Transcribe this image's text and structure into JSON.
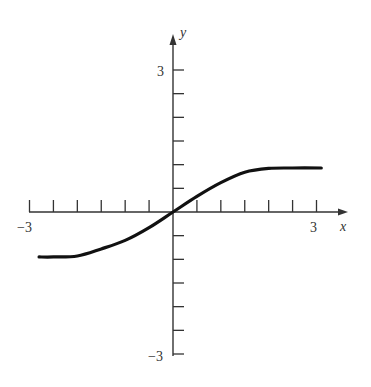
{
  "chart_data": {
    "type": "line",
    "title": "",
    "xlabel": "x",
    "ylabel": "y",
    "xlim": [
      -3,
      3
    ],
    "ylim": [
      -3,
      3
    ],
    "x_tick_labels": [
      "-3",
      "3"
    ],
    "y_tick_labels": [
      "3",
      "-3"
    ],
    "x_tick_step": 0.5,
    "y_tick_step": 0.5,
    "grid": false,
    "series": [
      {
        "name": "curve",
        "x": [
          -2.8,
          -2.5,
          -2.0,
          -1.5,
          -1.0,
          -0.5,
          0.0,
          0.5,
          1.0,
          1.5,
          2.0,
          2.5,
          3.1
        ],
        "y": [
          -0.95,
          -0.95,
          -0.93,
          -0.78,
          -0.6,
          -0.33,
          0.0,
          0.33,
          0.62,
          0.84,
          0.92,
          0.93,
          0.93
        ]
      }
    ]
  },
  "labels": {
    "x_axis": "x",
    "y_axis": "y",
    "x_min": "−3",
    "x_max": "3",
    "y_max": "3",
    "y_min": "−3"
  }
}
